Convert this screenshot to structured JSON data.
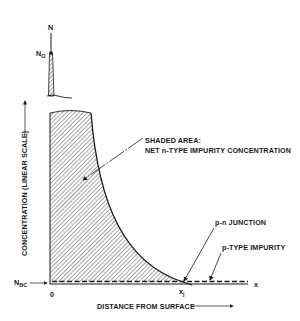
{
  "diagram": {
    "y_axis": {
      "top_label": "N",
      "peak_label": "N",
      "peak_label_sub": "O",
      "baseline_label": "N",
      "baseline_label_sub": "BC",
      "title": "CONCENTRATION (LINEAR SCALE)"
    },
    "x_axis": {
      "origin_label": "0",
      "end_label": "x",
      "junction_label": "x",
      "junction_label_sub": "j",
      "title": "DISTANCE FROM SURFACE"
    },
    "annotations": {
      "shaded_area_line1": "SHADED AREA:",
      "shaded_area_line2": "NET n-TYPE IMPURITY CONCENTRATION",
      "pn_junction": "p-n JUNCTION",
      "p_type": "p-TYPE IMPURITY"
    },
    "colors": {
      "ink": "#1a1a1a",
      "background": "#ffffff"
    }
  }
}
